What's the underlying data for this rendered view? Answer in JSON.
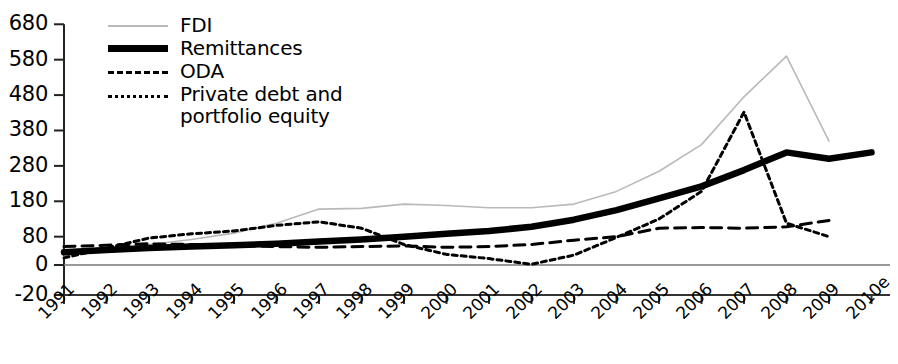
{
  "chart_data": {
    "type": "line",
    "title": "",
    "subtitle": "",
    "xlabel": "",
    "ylabel": "",
    "grid": false,
    "legend_position": "top-left",
    "x": [
      "1991",
      "1992",
      "1993",
      "1994",
      "1995",
      "1996",
      "1997",
      "1998",
      "1999",
      "2000",
      "2001",
      "2002",
      "2003",
      "2004",
      "2005",
      "2006",
      "2007",
      "2008",
      "2009",
      "2010e"
    ],
    "xtick_labels": [
      "1991",
      "1992",
      "1993",
      "1994",
      "1995",
      "1996",
      "1997",
      "1998",
      "1999",
      "2000",
      "2001",
      "2002",
      "2003",
      "2004",
      "2005",
      "2006",
      "2007",
      "2008",
      "2009",
      "2010e"
    ],
    "ytick_labels": [
      "-20",
      "0",
      "80",
      "180",
      "280",
      "380",
      "480",
      "580",
      "680"
    ],
    "ytick_values": [
      -20,
      0,
      80,
      180,
      280,
      380,
      480,
      580,
      680
    ],
    "ylim": [
      -20,
      680
    ],
    "series": [
      {
        "name": "FDI",
        "style": "solid-thin",
        "color": "#b9b9b9",
        "values": [
          25,
          40,
          58,
          72,
          90,
          118,
          158,
          160,
          172,
          168,
          162,
          162,
          172,
          208,
          265,
          340,
          475,
          590,
          350,
          null
        ]
      },
      {
        "name": "Remittances",
        "style": "solid-thick",
        "color": "#000000",
        "values": [
          36,
          42,
          48,
          52,
          56,
          60,
          66,
          72,
          80,
          88,
          96,
          108,
          128,
          155,
          188,
          222,
          268,
          318,
          300,
          318
        ]
      },
      {
        "name": "ODA",
        "style": "long-dash",
        "color": "#000000",
        "values": [
          52,
          56,
          60,
          58,
          55,
          52,
          50,
          52,
          54,
          50,
          52,
          58,
          70,
          80,
          104,
          106,
          104,
          108,
          126,
          null
        ]
      },
      {
        "name": "Private debt and portfolio equity",
        "style": "short-dash",
        "color": "#000000",
        "values": [
          20,
          48,
          76,
          88,
          96,
          112,
          122,
          104,
          58,
          30,
          18,
          2,
          28,
          78,
          130,
          208,
          432,
          118,
          80,
          null
        ]
      }
    ]
  },
  "legend": {
    "items": [
      {
        "label": "FDI",
        "sample": "solid-thin-line-sample"
      },
      {
        "label": "Remittances",
        "sample": "solid-thick-line-sample"
      },
      {
        "label": "ODA",
        "sample": "long-dash-line-sample"
      },
      {
        "label": "Private debt and\nportfolio equity",
        "sample": "short-dash-line-sample"
      }
    ],
    "item_0_label": "FDI",
    "item_1_label": "Remittances",
    "item_2_label": "ODA",
    "item_3_label_line1": "Private debt and",
    "item_3_label_line2": "portfolio equity"
  },
  "axis": {
    "y_labels": [
      "680",
      "580",
      "480",
      "380",
      "280",
      "180",
      "80",
      "0",
      "-20"
    ],
    "x_labels": [
      "1991",
      "1992",
      "1993",
      "1994",
      "1995",
      "1996",
      "1997",
      "1998",
      "1999",
      "2000",
      "2001",
      "2002",
      "2003",
      "2004",
      "2005",
      "2006",
      "2007",
      "2008",
      "2009",
      "2010e"
    ]
  }
}
